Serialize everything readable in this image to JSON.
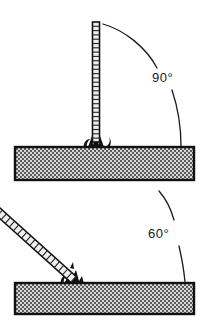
{
  "figure": {
    "background_color": "#ffffff",
    "line_color": "#1a1a1a",
    "plate_fill_color": "#c8c8c8",
    "electrode_fill_color": "#e8e8e8"
  },
  "panels": [
    {
      "id": "panel-top",
      "name": "vertical-electrode-panel",
      "angle_label": "90°",
      "angle_value": 90,
      "electrode": {
        "name": "electrode-vertical",
        "orientation": "vertical",
        "top": {
          "x": 96,
          "y": 22
        },
        "bottom": {
          "x": 96,
          "y": 142
        },
        "width": 7,
        "rung_count": 28
      },
      "workpiece": {
        "name": "workpiece-plate-top",
        "x": 15,
        "y": 147,
        "width": 179,
        "height": 33
      },
      "weld_point": {
        "x": 96,
        "y": 147
      },
      "leader_arc": {
        "start": {
          "x": 103,
          "y": 24
        },
        "end": {
          "x": 181,
          "y": 146
        },
        "label_gap_start": {
          "x": 158,
          "y": 68
        },
        "label_gap_end": {
          "x": 171,
          "y": 88
        }
      },
      "label_position": {
        "x": 152,
        "y": 82
      }
    },
    {
      "id": "panel-bottom",
      "name": "inclined-electrode-panel",
      "angle_label": "60°",
      "angle_value": 60,
      "electrode": {
        "name": "electrode-inclined",
        "orientation": "inclined",
        "top": {
          "x": 155,
          "y": 189
        },
        "bottom": {
          "x": 74,
          "y": 280
        },
        "width": 8,
        "rung_count": 22
      },
      "workpiece": {
        "name": "workpiece-plate-bottom",
        "x": 15,
        "y": 283,
        "width": 179,
        "height": 31
      },
      "weld_point": {
        "x": 74,
        "y": 283
      },
      "leader_arc": {
        "start": {
          "x": 159,
          "y": 191
        },
        "end": {
          "x": 185,
          "y": 282
        },
        "label_gap_start": {
          "x": 174,
          "y": 219
        },
        "label_gap_end": {
          "x": 180,
          "y": 244
        }
      },
      "label_position": {
        "x": 148,
        "y": 238
      }
    }
  ]
}
